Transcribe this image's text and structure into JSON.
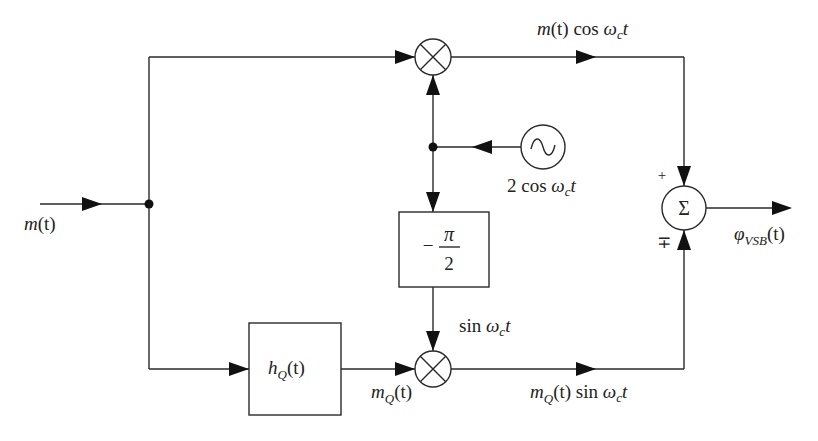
{
  "diagram": {
    "colors": {
      "line": "#2a2a2a",
      "arrow": "#111111",
      "background": "#ffffff",
      "text": "#222222"
    },
    "input": {
      "signal": "m",
      "arg": "(t)"
    },
    "output": {
      "symbol": "φ",
      "sub": "VSB",
      "arg": "(t)"
    },
    "oscillator": {
      "icon": "sine-wave-icon",
      "label_prefix": "2 cos ",
      "omega": "ω",
      "omega_sub": "c",
      "t": "t"
    },
    "phase_shifter": {
      "minus": "−",
      "num": "π",
      "den": "2"
    },
    "hilbert_filter": {
      "h": "h",
      "sub": "Q",
      "arg": "(t)"
    },
    "top_multiplier": {
      "icon": "multiplier-icon"
    },
    "bottom_multiplier": {
      "icon": "multiplier-icon"
    },
    "summer": {
      "symbol": "Σ",
      "sign_top": "+",
      "sign_bottom": "∓"
    },
    "labels": {
      "top_branch": {
        "m": "m",
        "arg": "(t) cos ",
        "omega": "ω",
        "omega_sub": "c",
        "t": "t"
      },
      "bottom_carrier": {
        "prefix": "sin ",
        "omega": "ω",
        "omega_sub": "c",
        "t": "t"
      },
      "mq": {
        "m": "m",
        "sub": "Q",
        "arg": "(t)"
      },
      "bottom_branch": {
        "m": "m",
        "sub": "Q",
        "arg": "(t) sin ",
        "omega": "ω",
        "omega_sub": "c",
        "t": "t"
      }
    }
  }
}
